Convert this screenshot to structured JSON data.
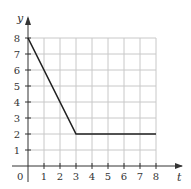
{
  "chart_data": {
    "type": "line",
    "title": "",
    "xlabel": "t",
    "ylabel": "y",
    "origin_label": "0",
    "x_ticks": [
      "1",
      "2",
      "3",
      "4",
      "5",
      "6",
      "7",
      "8"
    ],
    "y_ticks": [
      "1",
      "2",
      "3",
      "4",
      "5",
      "6",
      "7",
      "8"
    ],
    "xlim": [
      0,
      8
    ],
    "ylim": [
      0,
      8
    ],
    "grid": true,
    "series": [
      {
        "name": "y(t)",
        "points": [
          [
            0,
            8
          ],
          [
            3,
            2
          ],
          [
            8,
            2
          ]
        ]
      }
    ],
    "colors": {
      "line": "#222222",
      "grid": "#c8c8c8",
      "axis": "#333333"
    }
  }
}
